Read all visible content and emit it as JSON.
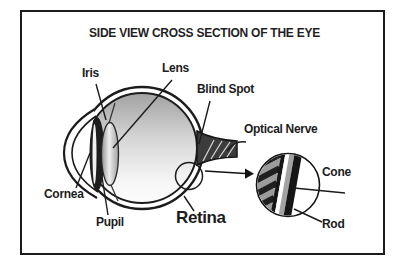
{
  "title": "SIDE VIEW CROSS SECTION OF THE EYE",
  "labels": {
    "iris": "Iris",
    "lens": "Lens",
    "blind_spot": "Blind Spot",
    "optical_nerve": "Optical Nerve",
    "cornea": "Cornea",
    "pupil": "Pupil",
    "retina": "Retina",
    "cone": "Cone",
    "rod": "Rod"
  },
  "colors": {
    "ink": "#1c1c1c",
    "background": "#ffffff",
    "eye_shade_top": "#a2a2a2",
    "nerve_fill": "#3c3c3c",
    "inset_dark_stripe": "#161616",
    "inset_gray_stripe": "#a3a3a3",
    "tooth_dark": "#1f1f1f",
    "tooth_gray": "#9b9b9b"
  }
}
